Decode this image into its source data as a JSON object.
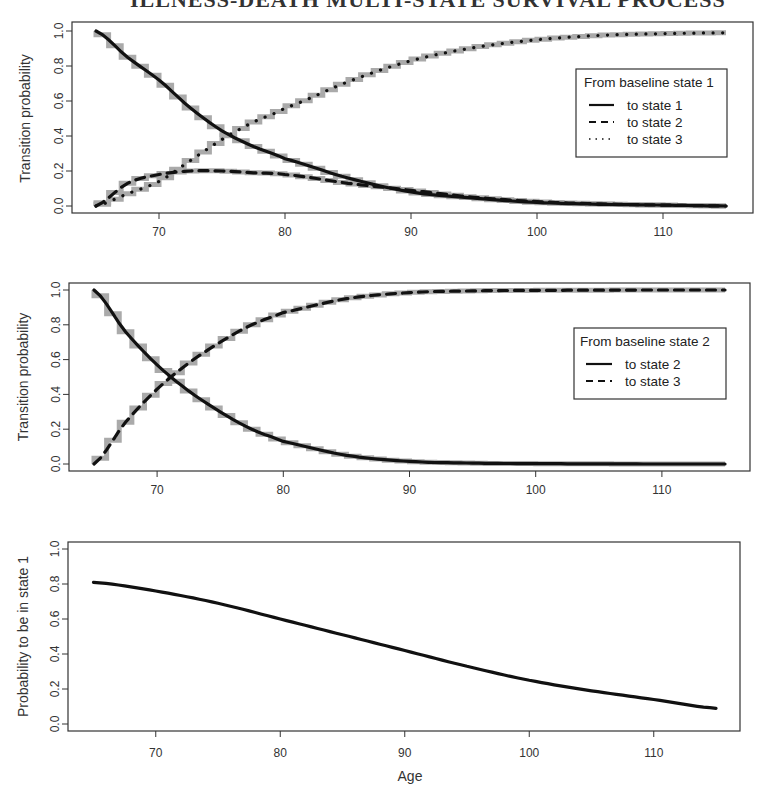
{
  "page_title": "ILLNESS-DEATH MULTI-STATE SURVIVAL PROCESS",
  "colors": {
    "curve": "#111111",
    "step": "#aaaaaa",
    "frame": "#333333"
  },
  "chart_data": [
    {
      "type": "line",
      "title": "",
      "xlabel": "",
      "ylabel": "Transition probability",
      "xlim": [
        63,
        119
      ],
      "ylim": [
        -0.04,
        1.04
      ],
      "xticks": [
        70,
        80,
        90,
        100,
        110
      ],
      "yticks": [
        "0.0",
        "0.2",
        "0.4",
        "0.6",
        "0.8",
        "1.0"
      ],
      "legend": {
        "title": "From baseline state 1",
        "position": "right-upper",
        "entries": [
          {
            "label": "to state 1",
            "style": "solid"
          },
          {
            "label": "to state 2",
            "style": "dashed"
          },
          {
            "label": "to state 3",
            "style": "dotted"
          }
        ]
      },
      "x": [
        65,
        67.5,
        70,
        72.5,
        75,
        77.5,
        80,
        85,
        90,
        95,
        100,
        105,
        110,
        115
      ],
      "series": [
        {
          "name": "to state 1",
          "style": "solid",
          "values": [
            1.0,
            0.85,
            0.72,
            0.56,
            0.43,
            0.34,
            0.27,
            0.16,
            0.08,
            0.045,
            0.02,
            0.01,
            0.005,
            0.0
          ]
        },
        {
          "name": "to state 2",
          "style": "dashed",
          "values": [
            0.0,
            0.13,
            0.18,
            0.2,
            0.2,
            0.19,
            0.18,
            0.13,
            0.09,
            0.05,
            0.025,
            0.012,
            0.005,
            0.0
          ]
        },
        {
          "name": "to state 3",
          "style": "dotted",
          "values": [
            0.0,
            0.07,
            0.14,
            0.26,
            0.38,
            0.48,
            0.56,
            0.71,
            0.83,
            0.905,
            0.95,
            0.975,
            0.985,
            0.99
          ]
        }
      ],
      "step_overlay": "empirical step functions (grey) underlying each curve"
    },
    {
      "type": "line",
      "title": "",
      "xlabel": "",
      "ylabel": "Transition probability",
      "xlim": [
        63,
        119
      ],
      "ylim": [
        -0.04,
        1.04
      ],
      "xticks": [
        70,
        80,
        90,
        100,
        110
      ],
      "yticks": [
        "0.0",
        "0.2",
        "0.4",
        "0.6",
        "0.8",
        "1.0"
      ],
      "legend": {
        "title": "From baseline state 2",
        "position": "right-middle",
        "entries": [
          {
            "label": "to state 2",
            "style": "solid"
          },
          {
            "label": "to state 3",
            "style": "dashed"
          }
        ]
      },
      "x": [
        65,
        67.5,
        70,
        72.5,
        75,
        77.5,
        80,
        85,
        90,
        95,
        100,
        105,
        110,
        115
      ],
      "series": [
        {
          "name": "to state 2",
          "style": "solid",
          "values": [
            1.0,
            0.76,
            0.57,
            0.42,
            0.3,
            0.2,
            0.13,
            0.05,
            0.015,
            0.005,
            0.002,
            0.001,
            0.0,
            0.0
          ]
        },
        {
          "name": "to state 3",
          "style": "dashed",
          "values": [
            0.0,
            0.24,
            0.43,
            0.58,
            0.7,
            0.8,
            0.87,
            0.95,
            0.985,
            0.995,
            0.998,
            0.999,
            1.0,
            1.0
          ]
        }
      ],
      "step_overlay": "empirical step functions (grey) underlying each curve"
    },
    {
      "type": "line",
      "title": "",
      "xlabel": "Age",
      "ylabel": "Probability to be in state 1",
      "xlim": [
        63,
        119
      ],
      "ylim": [
        -0.04,
        1.04
      ],
      "xticks": [
        70,
        80,
        90,
        100,
        110
      ],
      "yticks": [
        "0.0",
        "0.2",
        "0.4",
        "0.6",
        "0.8",
        "1.0"
      ],
      "x": [
        65,
        70,
        75,
        80,
        85,
        90,
        95,
        100,
        105,
        110,
        115
      ],
      "series": [
        {
          "name": "Probability to be in state 1",
          "style": "solid",
          "values": [
            0.81,
            0.76,
            0.69,
            0.6,
            0.51,
            0.42,
            0.33,
            0.25,
            0.19,
            0.14,
            0.09
          ]
        }
      ]
    }
  ],
  "panels": [
    {
      "ylabel": "Transition probability",
      "legend": {
        "title": "From baseline state 1",
        "items": [
          "to state 1",
          "to state 2",
          "to state 3"
        ]
      }
    },
    {
      "ylabel": "Transition probability",
      "legend": {
        "title": "From baseline state 2",
        "items": [
          "to state 2",
          "to state 3"
        ]
      }
    },
    {
      "ylabel": "Probability to be in state 1",
      "xlabel": "Age"
    }
  ],
  "xtick_labels": [
    "70",
    "80",
    "90",
    "100",
    "110"
  ],
  "ytick_labels": [
    "0.0",
    "0.2",
    "0.4",
    "0.6",
    "0.8",
    "1.0"
  ]
}
